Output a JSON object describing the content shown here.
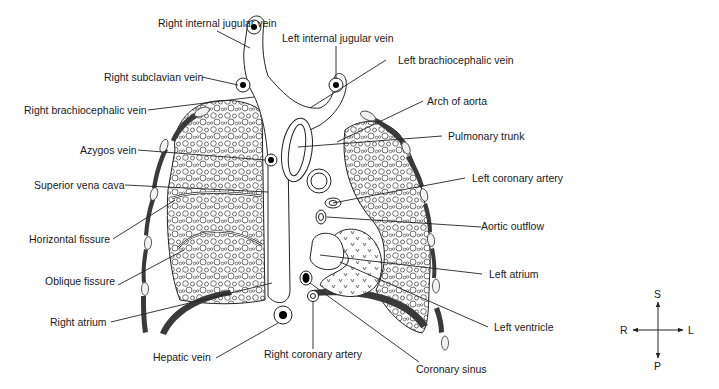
{
  "diagram": {
    "type": "anatomical cross-section (frontal view of thorax: heart, great vessels, lungs)",
    "labels": {
      "right_internal_jugular_vein": "Right internal jugular vein",
      "left_internal_jugular_vein": "Left internal jugular vein",
      "right_subclavian_vein": "Right subclavian vein",
      "left_brachiocephalic_vein": "Left brachiocephalic vein",
      "right_brachiocephalic_vein": "Right brachiocephalic vein",
      "arch_of_aorta": "Arch of aorta",
      "pulmonary_trunk": "Pulmonary trunk",
      "azygos_vein": "Azygos vein",
      "left_coronary_artery": "Left coronary artery",
      "superior_vena_cava": "Superior vena cava",
      "aortic_outflow": "Aortic outflow",
      "horizontal_fissure": "Horizontal fissure",
      "left_atrium": "Left atrium",
      "oblique_fissure": "Oblique fissure",
      "right_atrium": "Right atrium",
      "left_ventricle": "Left ventricle",
      "hepatic_vein": "Hepatic vein",
      "right_coronary_artery": "Right coronary artery",
      "coronary_sinus": "Coronary sinus"
    },
    "orientation": {
      "superior": "S",
      "posterior": "P",
      "right": "R",
      "left": "L"
    },
    "colors": {
      "line": "#222222",
      "rib_fill": "#3a3a3a",
      "background": "#ffffff"
    }
  }
}
